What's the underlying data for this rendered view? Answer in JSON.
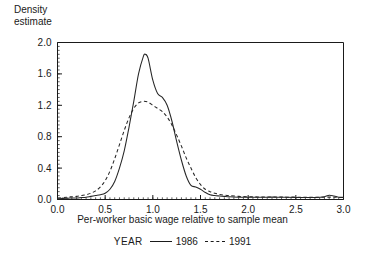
{
  "chart_data": {
    "type": "line",
    "title": "",
    "xlabel": "Per-worker basic wage relative to sample mean",
    "ylabel": "Density\nestimate",
    "ylabel_line1": "Density",
    "ylabel_line2": "estimate",
    "xlim": [
      0.0,
      3.0
    ],
    "ylim": [
      0.0,
      2.0
    ],
    "xticks": [
      "0.0",
      "0.5",
      "1.0",
      "1.5",
      "2.0",
      "2.5",
      "3.0"
    ],
    "xtick_values": [
      0.0,
      0.5,
      1.0,
      1.5,
      2.0,
      2.5,
      3.0
    ],
    "yticks": [
      "0.0",
      "0.4",
      "0.8",
      "1.2",
      "1.6",
      "2.0"
    ],
    "ytick_values": [
      0.0,
      0.4,
      0.8,
      1.2,
      1.6,
      2.0
    ],
    "xminor_step": 0.05,
    "yminor_step": 0.05,
    "grid": false,
    "legend_position": "below",
    "legend_title": "YEAR",
    "series": [
      {
        "name": "1986",
        "style": "solid",
        "color": "#262626",
        "x": [
          0.0,
          0.1,
          0.15,
          0.2,
          0.25,
          0.3,
          0.35,
          0.4,
          0.45,
          0.5,
          0.55,
          0.6,
          0.65,
          0.7,
          0.75,
          0.8,
          0.85,
          0.9,
          0.92,
          0.95,
          1.0,
          1.05,
          1.1,
          1.15,
          1.2,
          1.25,
          1.3,
          1.35,
          1.4,
          1.45,
          1.5,
          1.55,
          1.6,
          1.65,
          1.7,
          1.75,
          1.8,
          1.9,
          2.0,
          2.1,
          2.2,
          2.3,
          2.4,
          2.5,
          2.6,
          2.7,
          2.8,
          2.85,
          2.9,
          2.95,
          3.0
        ],
        "y": [
          0.01,
          0.015,
          0.02,
          0.02,
          0.025,
          0.03,
          0.04,
          0.05,
          0.06,
          0.08,
          0.13,
          0.23,
          0.4,
          0.62,
          0.92,
          1.25,
          1.6,
          1.82,
          1.85,
          1.8,
          1.52,
          1.35,
          1.3,
          1.2,
          1.0,
          0.74,
          0.5,
          0.3,
          0.18,
          0.16,
          0.13,
          0.09,
          0.06,
          0.05,
          0.045,
          0.04,
          0.035,
          0.03,
          0.028,
          0.028,
          0.03,
          0.03,
          0.028,
          0.026,
          0.025,
          0.025,
          0.035,
          0.055,
          0.045,
          0.03,
          0.025
        ]
      },
      {
        "name": "1991",
        "style": "dashed",
        "color": "#262626",
        "x": [
          0.0,
          0.1,
          0.15,
          0.2,
          0.25,
          0.3,
          0.35,
          0.4,
          0.45,
          0.5,
          0.55,
          0.6,
          0.65,
          0.7,
          0.75,
          0.8,
          0.85,
          0.9,
          0.95,
          1.0,
          1.05,
          1.1,
          1.15,
          1.2,
          1.25,
          1.3,
          1.35,
          1.4,
          1.45,
          1.5,
          1.55,
          1.6,
          1.65,
          1.7,
          1.75,
          1.8,
          1.9,
          2.0,
          2.1,
          2.2,
          2.3,
          2.4,
          2.5,
          2.6,
          2.7,
          2.8,
          2.9,
          3.0
        ],
        "y": [
          0.02,
          0.03,
          0.035,
          0.04,
          0.05,
          0.06,
          0.08,
          0.11,
          0.16,
          0.24,
          0.36,
          0.52,
          0.7,
          0.88,
          1.04,
          1.16,
          1.23,
          1.25,
          1.24,
          1.2,
          1.16,
          1.12,
          1.05,
          0.95,
          0.82,
          0.68,
          0.53,
          0.4,
          0.28,
          0.19,
          0.13,
          0.1,
          0.08,
          0.065,
          0.055,
          0.05,
          0.04,
          0.035,
          0.033,
          0.032,
          0.032,
          0.03,
          0.03,
          0.028,
          0.028,
          0.03,
          0.03,
          0.028
        ]
      }
    ]
  }
}
